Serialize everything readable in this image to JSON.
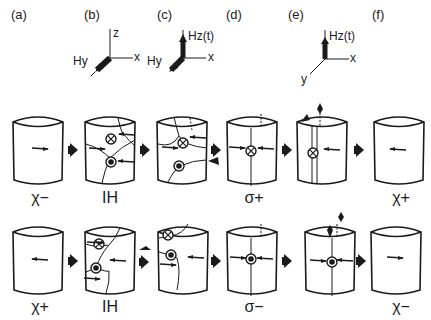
{
  "figure": {
    "panel_labels": [
      "(a)",
      "(b)",
      "(c)",
      "(d)",
      "(e)",
      "(f)"
    ],
    "axes_b": {
      "z": "z",
      "x": "x",
      "field": "Hy"
    },
    "axes_c": {
      "x": "x",
      "field_y": "Hy",
      "field_z": "Hz(t)"
    },
    "axes_e": {
      "x": "x",
      "y": "y",
      "field_z": "Hz(t)"
    },
    "row1": {
      "states": [
        "χ−",
        "IH",
        "σ+",
        "χ+"
      ]
    },
    "row2": {
      "states": [
        "χ+",
        "IH",
        "σ−",
        "χ−"
      ]
    },
    "colors": {
      "ink": "#1a1a1a",
      "background": "#ffffff"
    }
  }
}
